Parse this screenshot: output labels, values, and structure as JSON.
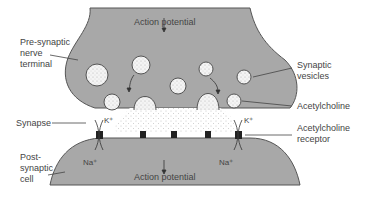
{
  "diagram": {
    "labels": {
      "presynaptic": [
        "Pre-synaptic",
        "nerve",
        "terminal"
      ],
      "action_potential_top": "Action potential",
      "synaptic_vesicles": [
        "Synaptic",
        "vesicles"
      ],
      "acetylcholine": "Acetylcholine",
      "synapse": "Synapse",
      "k_left": "K⁺",
      "k_right": "K⁺",
      "ach_receptor": [
        "Acetylcholine",
        "receptor"
      ],
      "postsynaptic": [
        "Post-",
        "synaptic",
        "cell"
      ],
      "na_left": "Na⁺",
      "na_right": "Na⁺",
      "action_potential_bottom": "Action potential"
    },
    "colors": {
      "cell_fill": "#a8a8a8",
      "outline": "#555555",
      "vesicle_fill": "#f4f4f4",
      "receptor": "#222222",
      "text": "#444444"
    }
  }
}
